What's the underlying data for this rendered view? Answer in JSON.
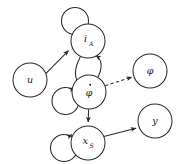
{
  "diagram": {
    "background_color": "#ffffff",
    "stroke_color": "#2b2b2b",
    "label_color": "#1a1a1a",
    "width": 183,
    "height": 164,
    "nodes": [
      {
        "id": "u",
        "label": "u",
        "subscript": "",
        "accent": "none",
        "cx": 30,
        "cy": 80,
        "r": 17
      },
      {
        "id": "i_A",
        "label": "i",
        "subscript": "A",
        "accent": "none",
        "cx": 88,
        "cy": 41,
        "r": 17
      },
      {
        "id": "phi_dot",
        "label": "φ",
        "subscript": "",
        "accent": "dot",
        "cx": 89,
        "cy": 92,
        "r": 17
      },
      {
        "id": "phi",
        "label": "φ",
        "subscript": "",
        "accent": "none",
        "cx": 150,
        "cy": 71,
        "r": 17
      },
      {
        "id": "x_S",
        "label": "x",
        "subscript": "S",
        "accent": "none",
        "cx": 88,
        "cy": 143,
        "r": 17
      },
      {
        "id": "y",
        "label": "y",
        "subscript": "",
        "accent": "none",
        "cx": 155,
        "cy": 121,
        "r": 17
      }
    ],
    "edges": [
      {
        "id": "u-to-iA",
        "from": "u",
        "to": "i_A",
        "style": "solid",
        "arrow": "single"
      },
      {
        "id": "iA-to-phidot",
        "from": "i_A",
        "to": "phi_dot",
        "style": "solid",
        "arrow": "single"
      },
      {
        "id": "phidot-to-iA",
        "from": "phi_dot",
        "to": "i_A",
        "style": "solid",
        "arrow": "single"
      },
      {
        "id": "phidot-to-phi",
        "from": "phi_dot",
        "to": "phi",
        "style": "dashed",
        "arrow": "single"
      },
      {
        "id": "phidot-to-xS",
        "from": "phi_dot",
        "to": "x_S",
        "style": "solid",
        "arrow": "single"
      },
      {
        "id": "xS-to-y",
        "from": "x_S",
        "to": "y",
        "style": "solid",
        "arrow": "single"
      },
      {
        "id": "iA-self-loop",
        "from": "i_A",
        "to": "i_A",
        "style": "solid",
        "arrow": "single"
      },
      {
        "id": "phidot-self-loop",
        "from": "phi_dot",
        "to": "phi_dot",
        "style": "solid",
        "arrow": "single"
      },
      {
        "id": "xS-self-loop",
        "from": "x_S",
        "to": "x_S",
        "style": "solid",
        "arrow": "single"
      }
    ]
  }
}
